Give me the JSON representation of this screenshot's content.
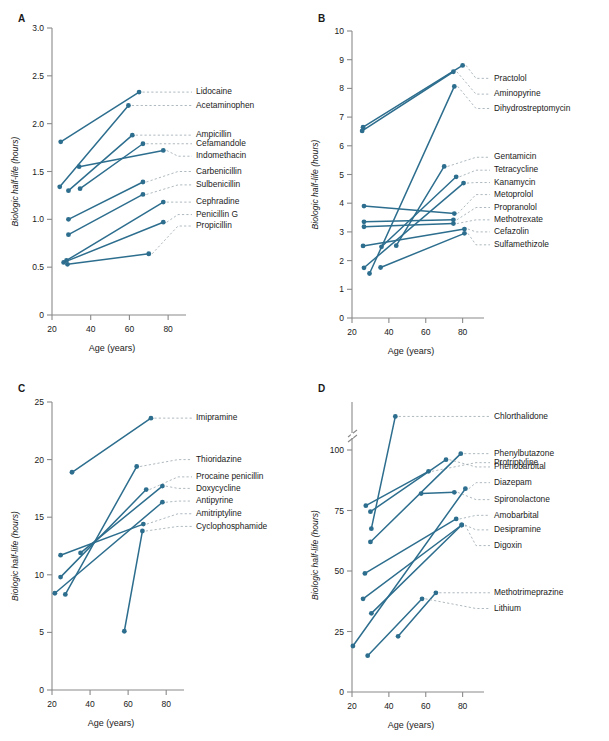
{
  "figure": {
    "line_color": "#2d6e8e",
    "axis_color": "#8a8a8a",
    "leader_color": "#9aa7ae",
    "background": "#ffffff"
  },
  "chart_data": [
    {
      "type": "line",
      "panel": "A",
      "title": "",
      "xlabel": "Age (years)",
      "ylabel": "Biologic half-life (hours)",
      "xlim": [
        20,
        82
      ],
      "ylim": [
        0,
        3.0
      ],
      "xticks": [
        20,
        40,
        60,
        80
      ],
      "xticklabels": [
        "20",
        "40",
        "60",
        "80"
      ],
      "yticks": [
        0,
        0.5,
        1.0,
        1.5,
        2.0,
        2.5,
        3.0
      ],
      "yticklabels": [
        "0",
        "0.5",
        "1.0",
        "1.5",
        "2.0",
        "2.5",
        "3.0"
      ],
      "grid": false,
      "legend": "right-leader-labels",
      "series": [
        {
          "name": "Lidocaine",
          "x": [
            24.5,
            65.0
          ],
          "values": [
            1.81,
            2.33
          ],
          "label_y": 2.33
        },
        {
          "name": "Acetaminophen",
          "x": [
            24.0,
            59.5
          ],
          "values": [
            1.34,
            2.19
          ],
          "label_y": 2.19
        },
        {
          "name": "Ampicillin",
          "x": [
            28.5,
            61.5
          ],
          "values": [
            1.3,
            1.88
          ],
          "label_y": 1.88
        },
        {
          "name": "Cefamandole",
          "x": [
            34.5,
            67.0
          ],
          "values": [
            1.32,
            1.79
          ],
          "label_y": 1.79
        },
        {
          "name": "Indomethacin",
          "x": [
            34.0,
            77.5
          ],
          "values": [
            1.55,
            1.72
          ],
          "label_y": 1.66
        },
        {
          "name": "Carbenicillin",
          "x": [
            28.5,
            67.0
          ],
          "values": [
            1.0,
            1.39
          ],
          "label_y": 1.5
        },
        {
          "name": "Sulbenicillin",
          "x": [
            28.5,
            67.0
          ],
          "values": [
            0.84,
            1.26
          ],
          "label_y": 1.36
        },
        {
          "name": "Cephradine",
          "x": [
            27.5,
            77.5
          ],
          "values": [
            0.57,
            1.18
          ],
          "label_y": 1.18
        },
        {
          "name": "Penicillin G",
          "x": [
            26.0,
            77.5
          ],
          "values": [
            0.55,
            0.97
          ],
          "label_y": 1.05
        },
        {
          "name": "Propicillin",
          "x": [
            28.0,
            70.0
          ],
          "values": [
            0.53,
            0.64
          ],
          "label_y": 0.93
        }
      ]
    },
    {
      "type": "line",
      "panel": "B",
      "title": "",
      "xlabel": "Age (years)",
      "ylabel": "Biologic half-life (hours)",
      "xlim": [
        20,
        84
      ],
      "ylim": [
        0,
        10
      ],
      "xticks": [
        20,
        40,
        60,
        80
      ],
      "xticklabels": [
        "20",
        "40",
        "60",
        "80"
      ],
      "yticks": [
        0,
        1,
        2,
        3,
        4,
        5,
        6,
        7,
        8,
        9,
        10
      ],
      "yticklabels": [
        "0",
        "1",
        "2",
        "3",
        "4",
        "5",
        "6",
        "7",
        "8",
        "9",
        "10"
      ],
      "grid": false,
      "legend": "right-leader-labels",
      "series": [
        {
          "name": "Practolol",
          "x": [
            26.0,
            80.0
          ],
          "values": [
            6.65,
            8.8
          ],
          "label_y": 8.35
        },
        {
          "name": "Aminopyrine",
          "x": [
            25.5,
            75.0
          ],
          "values": [
            6.52,
            8.58
          ],
          "label_y": 7.8
        },
        {
          "name": "Dihydrostreptomycin",
          "x": [
            29.5,
            75.5
          ],
          "values": [
            1.55,
            8.07
          ],
          "label_y": 7.3
        },
        {
          "name": "Gentamicin",
          "x": [
            44.0,
            70.0
          ],
          "values": [
            2.52,
            5.28
          ],
          "label_y": 5.6
        },
        {
          "name": "Tetracycline",
          "x": [
            36.0,
            76.5
          ],
          "values": [
            2.48,
            4.92
          ],
          "label_y": 5.15
        },
        {
          "name": "Kanamycin",
          "x": [
            26.5,
            80.5
          ],
          "values": [
            1.75,
            4.7
          ],
          "label_y": 4.72
        },
        {
          "name": "Metoprolol",
          "x": [
            26.5,
            75.5
          ],
          "values": [
            3.9,
            3.64
          ],
          "label_y": 4.3
        },
        {
          "name": "Propranolol",
          "x": [
            26.5,
            75.0
          ],
          "values": [
            3.35,
            3.42
          ],
          "label_y": 3.85
        },
        {
          "name": "Methotrexate",
          "x": [
            26.5,
            75.0
          ],
          "values": [
            3.18,
            3.29
          ],
          "label_y": 3.42
        },
        {
          "name": "Cefazolin",
          "x": [
            26.0,
            81.0
          ],
          "values": [
            2.51,
            3.1
          ],
          "label_y": 3.0
        },
        {
          "name": "Sulfamethizole",
          "x": [
            35.5,
            81.0
          ],
          "values": [
            1.76,
            2.95
          ],
          "label_y": 2.55
        }
      ]
    },
    {
      "type": "line",
      "panel": "C",
      "title": "",
      "xlabel": "Age (years)",
      "ylabel": "Biologic half-life (hours)",
      "xlim": [
        20,
        82
      ],
      "ylim": [
        0,
        25
      ],
      "xticks": [
        20,
        40,
        60,
        80
      ],
      "xticklabels": [
        "20",
        "40",
        "60",
        "80"
      ],
      "yticks": [
        0,
        5,
        10,
        15,
        20,
        25
      ],
      "yticklabels": [
        "0",
        "5",
        "10",
        "15",
        "20",
        "25"
      ],
      "grid": false,
      "legend": "right-leader-labels",
      "series": [
        {
          "name": "Imipramine",
          "x": [
            30.5,
            72.0
          ],
          "values": [
            18.9,
            23.6
          ],
          "label_y": 23.6
        },
        {
          "name": "Thioridazine",
          "x": [
            27.0,
            64.5
          ],
          "values": [
            8.3,
            19.4
          ],
          "label_y": 20.0
        },
        {
          "name": "Procaine penicillin",
          "x": [
            24.5,
            69.5
          ],
          "values": [
            9.8,
            17.4
          ],
          "label_y": 18.5
        },
        {
          "name": "Doxycycline",
          "x": [
            35.0,
            78.0
          ],
          "values": [
            11.9,
            17.7
          ],
          "label_y": 17.5
        },
        {
          "name": "Antipyrine",
          "x": [
            21.5,
            78.0
          ],
          "values": [
            8.4,
            16.3
          ],
          "label_y": 16.4
        },
        {
          "name": "Amitriptyline",
          "x": [
            24.5,
            68.0
          ],
          "values": [
            11.7,
            14.4
          ],
          "label_y": 15.3
        },
        {
          "name": "Cyclophosphamide",
          "x": [
            58.0,
            67.5
          ],
          "values": [
            5.1,
            13.8
          ],
          "label_y": 14.2
        }
      ]
    },
    {
      "type": "line",
      "panel": "D",
      "title": "",
      "xlabel": "Age (years)",
      "ylabel": "Biologic half-life (hours)",
      "xlim": [
        20,
        84
      ],
      "ylim": [
        0,
        125
      ],
      "xticks": [
        20,
        40,
        60,
        80
      ],
      "xticklabels": [
        "20",
        "40",
        "60",
        "80"
      ],
      "yticks": [
        0,
        25,
        50,
        75,
        100
      ],
      "yticklabels": [
        "0",
        "25",
        "50",
        "75",
        "100"
      ],
      "axis_break": {
        "below": 108,
        "above": 116,
        "note": "y-axis break above 100"
      },
      "grid": false,
      "legend": "right-leader-labels",
      "series": [
        {
          "name": "Chlorthalidone",
          "x": [
            30.5,
            43.5
          ],
          "values": [
            67.5,
            120.0
          ],
          "label_y": 120.0
        },
        {
          "name": "Protriptyline",
          "x": [
            27.5,
            61.5
          ],
          "values": [
            77.0,
            101.0
          ],
          "label_y": 104.0
        },
        {
          "name": "Phenylbutazone",
          "x": [
            30.0,
            79.0
          ],
          "values": [
            62.0,
            98.5
          ],
          "label_y": 98.5
        },
        {
          "name": "Phenobarbital",
          "x": [
            30.0,
            71.0
          ],
          "values": [
            74.5,
            96.0
          ],
          "label_y": 93.0
        },
        {
          "name": "Diazepam",
          "x": [
            20.5,
            81.5
          ],
          "values": [
            19.0,
            84.0
          ],
          "label_y": 86.5
        },
        {
          "name": "Spironolactone",
          "x": [
            57.5,
            75.5
          ],
          "values": [
            82.0,
            82.5
          ],
          "label_y": 79.5
        },
        {
          "name": "Amobarbital",
          "x": [
            27.0,
            76.5
          ],
          "values": [
            49.0,
            71.5
          ],
          "label_y": 73.0
        },
        {
          "name": "Desipramine",
          "x": [
            26.0,
            79.5
          ],
          "values": [
            38.5,
            69.0
          ],
          "label_y": 67.0
        },
        {
          "name": "Digoxin",
          "x": [
            30.5,
            79.5
          ],
          "values": [
            32.5,
            69.0
          ],
          "label_y": 60.5
        },
        {
          "name": "Methotrimeprazine",
          "x": [
            45.0,
            65.5
          ],
          "values": [
            23.0,
            41.0
          ],
          "label_y": 41.0
        },
        {
          "name": "Lithium",
          "x": [
            28.5,
            58.0
          ],
          "values": [
            15.0,
            38.5
          ],
          "label_y": 34.5
        }
      ]
    }
  ]
}
